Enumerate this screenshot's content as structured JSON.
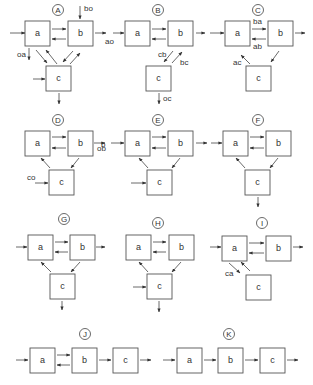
{
  "box_size": 25,
  "panels": [
    {
      "id": "A",
      "label": "A",
      "label_pos": [
        58,
        10
      ],
      "boxes": {
        "a": [
          25,
          21
        ],
        "b": [
          68,
          21
        ],
        "c": [
          46,
          66
        ]
      },
      "arrows": [
        {
          "from": [
            10,
            33
          ],
          "to": [
            25,
            33
          ]
        },
        {
          "from": [
            52,
            29
          ],
          "to": [
            66,
            29
          ]
        },
        {
          "from": [
            66,
            39
          ],
          "to": [
            52,
            39
          ]
        },
        {
          "from": [
            80,
            6
          ],
          "to": [
            80,
            19
          ]
        },
        {
          "from": [
            95,
            33
          ],
          "to": [
            106,
            33
          ]
        },
        {
          "from": [
            29,
            48
          ],
          "to": [
            29,
            60
          ]
        },
        {
          "from": [
            36,
            50
          ],
          "to": [
            47,
            63
          ]
        },
        {
          "from": [
            57,
            64
          ],
          "to": [
            46,
            50
          ]
        },
        {
          "from": [
            73,
            51
          ],
          "to": [
            63,
            62
          ]
        },
        {
          "from": [
            70,
            64
          ],
          "to": [
            80,
            53
          ]
        },
        {
          "from": [
            33,
            79
          ],
          "to": [
            45,
            79
          ]
        },
        {
          "from": [
            59,
            93
          ],
          "to": [
            59,
            104
          ]
        }
      ],
      "labels": [
        {
          "text": "bo",
          "pos": [
            84,
            11
          ]
        },
        {
          "text": "ao",
          "pos": [
            105,
            44
          ]
        },
        {
          "text": "oa",
          "pos": [
            17,
            57
          ]
        }
      ]
    },
    {
      "id": "B",
      "label": "B",
      "label_pos": [
        158,
        10
      ],
      "boxes": {
        "a": [
          125,
          21
        ],
        "b": [
          168,
          21
        ],
        "c": [
          146,
          66
        ]
      },
      "arrows": [
        {
          "from": [
            113,
            33
          ],
          "to": [
            124,
            33
          ]
        },
        {
          "from": [
            152,
            29
          ],
          "to": [
            166,
            29
          ]
        },
        {
          "from": [
            166,
            39
          ],
          "to": [
            152,
            39
          ]
        },
        {
          "from": [
            196,
            33
          ],
          "to": [
            205,
            33
          ]
        },
        {
          "from": [
            173,
            51
          ],
          "to": [
            164,
            62
          ]
        },
        {
          "from": [
            172,
            63
          ],
          "to": [
            182,
            52
          ]
        },
        {
          "from": [
            159,
            93
          ],
          "to": [
            159,
            104
          ]
        }
      ],
      "labels": [
        {
          "text": "cb",
          "pos": [
            158,
            57
          ]
        },
        {
          "text": "bc",
          "pos": [
            180,
            65
          ]
        },
        {
          "text": "oc",
          "pos": [
            163,
            101
          ]
        }
      ]
    },
    {
      "id": "C",
      "label": "C",
      "label_pos": [
        258,
        10
      ],
      "boxes": {
        "a": [
          225,
          21
        ],
        "b": [
          268,
          21
        ],
        "c": [
          246,
          66
        ]
      },
      "arrows": [
        {
          "from": [
            210,
            33
          ],
          "to": [
            224,
            33
          ]
        },
        {
          "from": [
            252,
            29
          ],
          "to": [
            266,
            29
          ]
        },
        {
          "from": [
            266,
            39
          ],
          "to": [
            252,
            39
          ]
        },
        {
          "from": [
            295,
            33
          ],
          "to": [
            305,
            33
          ]
        },
        {
          "from": [
            250,
            64
          ],
          "to": [
            241,
            55
          ]
        },
        {
          "from": [
            279,
            51
          ],
          "to": [
            271,
            62
          ]
        }
      ],
      "labels": [
        {
          "text": "ba",
          "pos": [
            253,
            24
          ]
        },
        {
          "text": "ab",
          "pos": [
            253,
            49
          ]
        },
        {
          "text": "ac",
          "pos": [
            233,
            65
          ]
        }
      ]
    },
    {
      "id": "D",
      "label": "D",
      "label_pos": [
        58,
        120
      ],
      "boxes": {
        "a": [
          25,
          131
        ],
        "b": [
          68,
          131
        ],
        "c": [
          49,
          170
        ]
      },
      "arrows": [
        {
          "from": [
            52,
            137
          ],
          "to": [
            66,
            137
          ]
        },
        {
          "from": [
            66,
            148
          ],
          "to": [
            52,
            148
          ]
        },
        {
          "from": [
            94,
            143
          ],
          "to": [
            105,
            143
          ]
        },
        {
          "from": [
            50,
            168
          ],
          "to": [
            41,
            158
          ]
        },
        {
          "from": [
            79,
            158
          ],
          "to": [
            71,
            168
          ]
        },
        {
          "from": [
            35,
            183
          ],
          "to": [
            48,
            183
          ]
        }
      ],
      "labels": [
        {
          "text": "ob",
          "pos": [
            97,
            151
          ]
        },
        {
          "text": "co",
          "pos": [
            27,
            180
          ]
        }
      ]
    },
    {
      "id": "E",
      "label": "E",
      "label_pos": [
        158,
        120
      ],
      "boxes": {
        "a": [
          125,
          131
        ],
        "b": [
          168,
          131
        ],
        "c": [
          147,
          170
        ]
      },
      "arrows": [
        {
          "from": [
            111,
            143
          ],
          "to": [
            124,
            143
          ]
        },
        {
          "from": [
            152,
            137
          ],
          "to": [
            166,
            137
          ]
        },
        {
          "from": [
            166,
            148
          ],
          "to": [
            152,
            148
          ]
        },
        {
          "from": [
            196,
            143
          ],
          "to": [
            207,
            143
          ]
        },
        {
          "from": [
            148,
            168
          ],
          "to": [
            139,
            158
          ]
        },
        {
          "from": [
            180,
            158
          ],
          "to": [
            172,
            168
          ]
        },
        {
          "from": [
            131,
            183
          ],
          "to": [
            146,
            183
          ]
        }
      ],
      "labels": [
        {
          "text": "b",
          "pos": [
            101,
            147
          ]
        }
      ]
    },
    {
      "id": "F",
      "label": "F",
      "label_pos": [
        258,
        120
      ],
      "boxes": {
        "a": [
          223,
          131
        ],
        "b": [
          266,
          131
        ],
        "c": [
          245,
          170
        ]
      },
      "arrows": [
        {
          "from": [
            211,
            143
          ],
          "to": [
            222,
            143
          ]
        },
        {
          "from": [
            250,
            137
          ],
          "to": [
            264,
            137
          ]
        },
        {
          "from": [
            264,
            148
          ],
          "to": [
            250,
            148
          ]
        },
        {
          "from": [
            245,
            168
          ],
          "to": [
            236,
            158
          ]
        },
        {
          "from": [
            278,
            158
          ],
          "to": [
            270,
            168
          ]
        },
        {
          "from": [
            258,
            197
          ],
          "to": [
            258,
            207
          ]
        }
      ],
      "labels": []
    },
    {
      "id": "G",
      "label": "G",
      "label_pos": [
        64,
        219
      ],
      "boxes": {
        "a": [
          28,
          235
        ],
        "b": [
          70,
          235
        ],
        "c": [
          50,
          274
        ]
      },
      "arrows": [
        {
          "from": [
            16,
            247
          ],
          "to": [
            27,
            247
          ]
        },
        {
          "from": [
            55,
            242
          ],
          "to": [
            68,
            242
          ]
        },
        {
          "from": [
            68,
            252
          ],
          "to": [
            55,
            252
          ]
        },
        {
          "from": [
            96,
            247
          ],
          "to": [
            105,
            247
          ]
        },
        {
          "from": [
            51,
            272
          ],
          "to": [
            41,
            262
          ]
        },
        {
          "from": [
            80,
            262
          ],
          "to": [
            71,
            272
          ]
        },
        {
          "from": [
            62,
            301
          ],
          "to": [
            62,
            310
          ]
        }
      ],
      "labels": []
    },
    {
      "id": "H",
      "label": "H",
      "label_pos": [
        158,
        223
      ],
      "boxes": {
        "a": [
          126,
          235
        ],
        "b": [
          169,
          235
        ],
        "c": [
          147,
          274
        ]
      },
      "arrows": [
        {
          "from": [
            153,
            242
          ],
          "to": [
            166,
            242
          ]
        },
        {
          "from": [
            166,
            252
          ],
          "to": [
            153,
            252
          ]
        },
        {
          "from": [
            148,
            272
          ],
          "to": [
            139,
            262
          ]
        },
        {
          "from": [
            181,
            262
          ],
          "to": [
            172,
            272
          ]
        },
        {
          "from": [
            133,
            287
          ],
          "to": [
            146,
            287
          ]
        },
        {
          "from": [
            159,
            301
          ],
          "to": [
            159,
            312
          ]
        }
      ],
      "labels": []
    },
    {
      "id": "I",
      "label": "I",
      "label_pos": [
        262,
        223
      ],
      "boxes": {
        "a": [
          222,
          236
        ],
        "b": [
          266,
          236
        ],
        "c": [
          246,
          275
        ]
      },
      "arrows": [
        {
          "from": [
            210,
            247
          ],
          "to": [
            221,
            247
          ]
        },
        {
          "from": [
            249,
            243
          ],
          "to": [
            264,
            243
          ]
        },
        {
          "from": [
            264,
            253
          ],
          "to": [
            249,
            253
          ]
        },
        {
          "from": [
            293,
            247
          ],
          "to": [
            303,
            247
          ]
        },
        {
          "from": [
            229,
            263
          ],
          "to": [
            240,
            273
          ]
        },
        {
          "from": [
            250,
            271
          ],
          "to": [
            241,
            262
          ]
        }
      ],
      "labels": [
        {
          "text": "ca",
          "pos": [
            225,
            276
          ]
        }
      ]
    },
    {
      "id": "J",
      "label": "J",
      "label_pos": [
        85,
        334
      ],
      "boxes": {
        "a": [
          30,
          348
        ],
        "b": [
          72,
          348
        ],
        "c": [
          113,
          348
        ]
      },
      "arrows": [
        {
          "from": [
            16,
            360
          ],
          "to": [
            28,
            360
          ]
        },
        {
          "from": [
            57,
            355
          ],
          "to": [
            70,
            355
          ]
        },
        {
          "from": [
            70,
            365
          ],
          "to": [
            57,
            365
          ]
        },
        {
          "from": [
            99,
            360
          ],
          "to": [
            111,
            360
          ]
        },
        {
          "from": [
            140,
            360
          ],
          "to": [
            151,
            360
          ]
        }
      ],
      "labels": []
    },
    {
      "id": "K",
      "label": "K",
      "label_pos": [
        229,
        334
      ],
      "boxes": {
        "a": [
          177,
          348
        ],
        "b": [
          218,
          348
        ],
        "c": [
          260,
          348
        ]
      },
      "arrows": [
        {
          "from": [
            163,
            360
          ],
          "to": [
            175,
            360
          ]
        },
        {
          "from": [
            204,
            360
          ],
          "to": [
            216,
            360
          ]
        },
        {
          "from": [
            245,
            360
          ],
          "to": [
            258,
            360
          ]
        },
        {
          "from": [
            287,
            360
          ],
          "to": [
            298,
            360
          ]
        }
      ],
      "labels": []
    }
  ]
}
